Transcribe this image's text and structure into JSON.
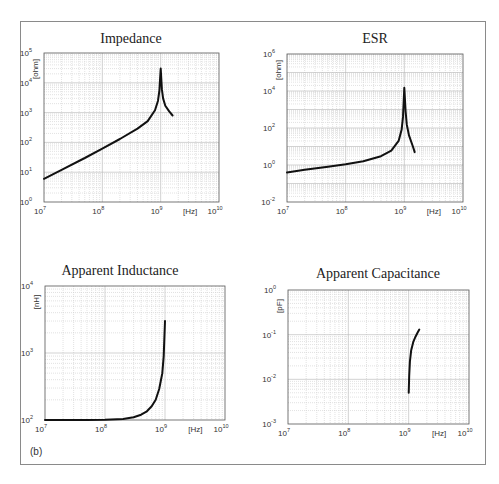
{
  "figure": {
    "panel_label": "(b)"
  },
  "chart_data": [
    {
      "type": "line",
      "title": "Impedance",
      "xlabel": "[Hz]",
      "ylabel": "[ohm]",
      "xscale": "log",
      "yscale": "log",
      "xlim": [
        10000000.0,
        10000000000.0
      ],
      "ylim": [
        1.0,
        100000.0
      ],
      "xticks": [
        "10^7",
        "10^8",
        "10^9",
        "10^10"
      ],
      "yticks": [
        "10^0",
        "10^1",
        "10^2",
        "10^3",
        "10^4",
        "10^5"
      ],
      "grid": true,
      "series": [
        {
          "name": "Impedance",
          "x": [
            10000000.0,
            20000000.0,
            50000000.0,
            100000000.0,
            200000000.0,
            400000000.0,
            600000000.0,
            800000000.0,
            900000000.0,
            950000000.0,
            1000000000.0,
            1050000000.0,
            1100000000.0,
            1200000000.0,
            1400000000.0,
            1600000000.0
          ],
          "y": [
            6,
            12,
            30,
            62,
            130,
            290,
            520,
            1200,
            2500,
            5500,
            30000,
            6000,
            3000,
            1700,
            1100,
            800
          ]
        }
      ]
    },
    {
      "type": "line",
      "title": "ESR",
      "xlabel": "[Hz]",
      "ylabel": "[ohm]",
      "xscale": "log",
      "yscale": "log",
      "xlim": [
        10000000.0,
        10000000000.0
      ],
      "ylim": [
        0.01,
        1000000.0
      ],
      "xticks": [
        "10^7",
        "10^8",
        "10^9",
        "10^10"
      ],
      "yticks": [
        "10^-2",
        "10^0",
        "10^2",
        "10^4",
        "10^6"
      ],
      "grid": true,
      "series": [
        {
          "name": "ESR",
          "x": [
            10000000.0,
            20000000.0,
            50000000.0,
            100000000.0,
            200000000.0,
            400000000.0,
            600000000.0,
            800000000.0,
            900000000.0,
            950000000.0,
            1000000000.0,
            1050000000.0,
            1100000000.0,
            1200000000.0,
            1400000000.0,
            1500000000.0
          ],
          "y": [
            0.4,
            0.55,
            0.8,
            1.1,
            1.6,
            3,
            6,
            20,
            80,
            400,
            15000,
            800,
            150,
            40,
            10,
            5
          ]
        }
      ]
    },
    {
      "type": "line",
      "title": "Apparent Inductance",
      "xlabel": "[Hz]",
      "ylabel": "[nH]",
      "xscale": "log",
      "yscale": "log",
      "xlim": [
        10000000.0,
        10000000000.0
      ],
      "ylim": [
        100.0,
        10000.0
      ],
      "xticks": [
        "10^7",
        "10^8",
        "10^9",
        "10^10"
      ],
      "yticks": [
        "10^2",
        "10^3",
        "10^4"
      ],
      "grid": true,
      "series": [
        {
          "name": "Apparent Inductance",
          "x": [
            10000000.0,
            50000000.0,
            100000000.0,
            200000000.0,
            300000000.0,
            400000000.0,
            500000000.0,
            600000000.0,
            700000000.0,
            800000000.0,
            900000000.0,
            950000000.0,
            1000000000.0
          ],
          "y": [
            100,
            100,
            101,
            104,
            110,
            120,
            135,
            160,
            200,
            290,
            500,
            900,
            3000
          ]
        }
      ]
    },
    {
      "type": "line",
      "title": "Apparent Capacitance",
      "xlabel": "[Hz]",
      "ylabel": "[pF]",
      "xscale": "log",
      "yscale": "log",
      "xlim": [
        10000000.0,
        10000000000.0
      ],
      "ylim": [
        0.001,
        1.0
      ],
      "xticks": [
        "10^7",
        "10^8",
        "10^9",
        "10^10"
      ],
      "yticks": [
        "10^-3",
        "10^-2",
        "10^-1",
        "10^0"
      ],
      "grid": true,
      "series": [
        {
          "name": "Apparent Capacitance",
          "x": [
            1000000000.0,
            1020000000.0,
            1050000000.0,
            1100000000.0,
            1200000000.0,
            1300000000.0,
            1400000000.0,
            1500000000.0
          ],
          "y": [
            0.005,
            0.012,
            0.025,
            0.045,
            0.07,
            0.09,
            0.11,
            0.13
          ]
        }
      ]
    }
  ],
  "layout": {
    "plots": [
      {
        "left": 44,
        "top": 53,
        "right": 219,
        "bottom": 202,
        "title_x": 131,
        "title_y": 43
      },
      {
        "left": 287,
        "top": 54,
        "right": 463,
        "bottom": 202,
        "title_x": 375,
        "title_y": 43
      },
      {
        "left": 45,
        "top": 286,
        "right": 225,
        "bottom": 420,
        "title_x": 120,
        "title_y": 275
      },
      {
        "left": 288,
        "top": 290,
        "right": 469,
        "bottom": 424,
        "title_x": 378,
        "title_y": 278
      }
    ]
  }
}
